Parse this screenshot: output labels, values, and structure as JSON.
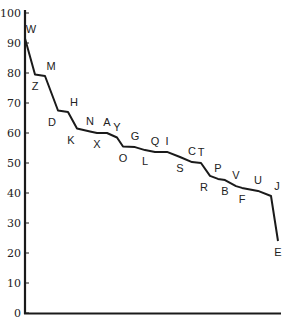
{
  "chart_data": {
    "type": "line",
    "title": "",
    "xlabel": "",
    "ylabel": "",
    "ylim": [
      0,
      100
    ],
    "yticks": [
      0,
      10,
      20,
      30,
      40,
      50,
      60,
      70,
      80,
      90,
      100
    ],
    "grid": false,
    "legend": null,
    "colors": {
      "line": "#1a1a1a",
      "axis": "#1a1a1a",
      "text": "#222222"
    },
    "points": [
      {
        "label": "W",
        "x": 0,
        "y": 91.5,
        "label_pos": "above-right"
      },
      {
        "label": "Z",
        "x": 10,
        "y": 79.5,
        "label_pos": "below"
      },
      {
        "label": "M",
        "x": 20,
        "y": 79,
        "label_pos": "above-right"
      },
      {
        "label": "D",
        "x": 33,
        "y": 67.5,
        "label_pos": "below-left"
      },
      {
        "label": "H",
        "x": 43,
        "y": 67,
        "label_pos": "above-right"
      },
      {
        "label": "K",
        "x": 52,
        "y": 61.5,
        "label_pos": "below-left"
      },
      {
        "label": "N",
        "x": 65,
        "y": 60.5,
        "label_pos": "above"
      },
      {
        "label": "X",
        "x": 72,
        "y": 60,
        "label_pos": "below"
      },
      {
        "label": "A",
        "x": 82,
        "y": 60,
        "label_pos": "above"
      },
      {
        "label": "Y",
        "x": 92,
        "y": 58.5,
        "label_pos": "above"
      },
      {
        "label": "O",
        "x": 98,
        "y": 55.5,
        "label_pos": "below"
      },
      {
        "label": "G",
        "x": 110,
        "y": 55.3,
        "label_pos": "above"
      },
      {
        "label": "L",
        "x": 120,
        "y": 54.3,
        "label_pos": "below"
      },
      {
        "label": "Q",
        "x": 130,
        "y": 53.7,
        "label_pos": "above"
      },
      {
        "label": "I",
        "x": 142,
        "y": 53.7,
        "label_pos": "above"
      },
      {
        "label": "S",
        "x": 155,
        "y": 52,
        "label_pos": "below"
      },
      {
        "label": "C",
        "x": 167,
        "y": 50.3,
        "label_pos": "above"
      },
      {
        "label": "T",
        "x": 176,
        "y": 50,
        "label_pos": "above"
      },
      {
        "label": "R",
        "x": 185,
        "y": 45.7,
        "label_pos": "below-left"
      },
      {
        "label": "P",
        "x": 193,
        "y": 44.7,
        "label_pos": "above"
      },
      {
        "label": "B",
        "x": 200,
        "y": 44.3,
        "label_pos": "below"
      },
      {
        "label": "V",
        "x": 211,
        "y": 42.3,
        "label_pos": "above"
      },
      {
        "label": "F",
        "x": 217,
        "y": 41.7,
        "label_pos": "below"
      },
      {
        "label": "U",
        "x": 233,
        "y": 40.7,
        "label_pos": "above"
      },
      {
        "label": "J",
        "x": 246,
        "y": 39,
        "label_pos": "above-right"
      },
      {
        "label": "E",
        "x": 253,
        "y": 24,
        "label_pos": "below"
      }
    ],
    "categories": [
      "W",
      "Z",
      "M",
      "D",
      "H",
      "K",
      "N",
      "X",
      "A",
      "Y",
      "O",
      "G",
      "L",
      "Q",
      "I",
      "S",
      "C",
      "T",
      "R",
      "P",
      "B",
      "V",
      "F",
      "U",
      "J",
      "E"
    ],
    "values": [
      91.5,
      79.5,
      79,
      67.5,
      67,
      61.5,
      60.5,
      60,
      60,
      58.5,
      55.5,
      55.3,
      54.3,
      53.7,
      53.7,
      52,
      50.3,
      50,
      45.7,
      44.7,
      44.3,
      42.3,
      41.7,
      40.7,
      39,
      24
    ]
  }
}
